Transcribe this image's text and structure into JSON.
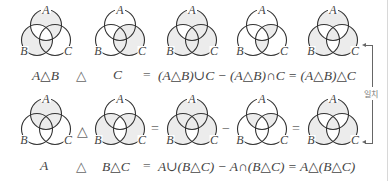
{
  "colors": {
    "shade": "#ececec",
    "stroke": "#333333",
    "text": "#444444"
  },
  "set_labels": {
    "a": "A",
    "b": "B",
    "c": "C"
  },
  "rows": [
    {
      "diagrams": [
        {
          "shaded": [
            "A_only",
            "B_only",
            "AC_only",
            "BC_only"
          ]
        },
        {
          "shaded": [
            "C_only",
            "AC_only",
            "BC_only",
            "ABC"
          ]
        },
        {
          "shaded": [
            "A_only",
            "B_only",
            "C_only",
            "AC_only",
            "BC_only",
            "ABC"
          ]
        },
        {
          "shaded": [
            "AC_only",
            "BC_only"
          ]
        },
        {
          "shaded": [
            "A_only",
            "B_only",
            "C_only",
            "ABC"
          ]
        }
      ],
      "operators": [
        "△",
        "=",
        "−",
        "="
      ],
      "captions": {
        "c1": "A△B",
        "op1": "△",
        "c2": "C",
        "op2": "=",
        "c3": "(A△B)∪C − (A△B)∩C = (A△B)△C"
      }
    },
    {
      "diagrams": [
        {
          "shaded": [
            "A_only",
            "AB_only",
            "AC_only",
            "ABC"
          ]
        },
        {
          "shaded": [
            "B_only",
            "C_only",
            "AB_only",
            "AC_only"
          ]
        },
        {
          "shaded": [
            "A_only",
            "B_only",
            "C_only",
            "AB_only",
            "AC_only",
            "ABC"
          ]
        },
        {
          "shaded": [
            "AB_only",
            "AC_only"
          ]
        },
        {
          "shaded": [
            "A_only",
            "B_only",
            "C_only",
            "ABC"
          ]
        }
      ],
      "operators": [
        "△",
        "=",
        "−",
        "="
      ],
      "captions": {
        "c1": "A",
        "op1": "△",
        "c2": "B△C",
        "op2": "=",
        "c3": "A∪(B△C) − A∩(B△C) = A△(B△C)"
      }
    }
  ],
  "match_label": "일치"
}
